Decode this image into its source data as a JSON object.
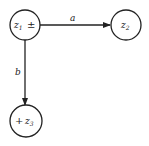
{
  "diagram": {
    "nodes": [
      {
        "id": "z1",
        "var": "z",
        "sub": "1",
        "sign": "±",
        "sign_position": "right",
        "cx": 25,
        "cy": 25,
        "r": 15
      },
      {
        "id": "z2",
        "var": "z",
        "sub": "2",
        "sign": "",
        "cx": 126,
        "cy": 25,
        "r": 15
      },
      {
        "id": "z3",
        "var": "z",
        "sub": "3",
        "sign": "+",
        "sign_position": "left",
        "cx": 26,
        "cy": 121,
        "r": 16
      }
    ],
    "edges": [
      {
        "from": "z1",
        "to": "z2",
        "label": "a"
      },
      {
        "from": "z1",
        "to": "z3",
        "label": "b"
      }
    ],
    "colors": {
      "stroke": "#222222",
      "background": "#ffffff"
    }
  }
}
